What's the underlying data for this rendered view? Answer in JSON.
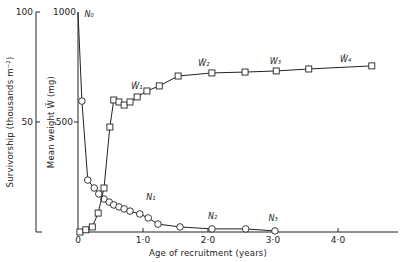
{
  "chart_data": {
    "type": "line",
    "title": "",
    "xlabel": "Age of recruitment (years)",
    "ylabel_left_outer": "Survivorship (thousands m⁻²)",
    "ylabel_left_inner": "Mean weight W̄ (mg)",
    "xlim": [
      0,
      4.9
    ],
    "ylim_survivorship": [
      0,
      100
    ],
    "ylim_weight": [
      0,
      1000
    ],
    "x_ticks": [
      {
        "value": 0,
        "label": "0"
      },
      {
        "value": 1,
        "label": "1·0"
      },
      {
        "value": 2,
        "label": "2·0"
      },
      {
        "value": 3,
        "label": "3·0"
      },
      {
        "value": 4,
        "label": "4·0"
      }
    ],
    "y_ticks_survivorship": [
      {
        "value": 50,
        "label": "50"
      },
      {
        "value": 100,
        "label": "100"
      }
    ],
    "y_ticks_weight": [
      {
        "value": 500,
        "label": "500"
      },
      {
        "value": 1000,
        "label": "1000"
      }
    ],
    "grid": false,
    "legend": null,
    "series": [
      {
        "name": "Survivorship N",
        "axis": "survivorship",
        "marker": "circle",
        "x": [
          0.0,
          0.06,
          0.15,
          0.25,
          0.32,
          0.4,
          0.48,
          0.55,
          0.63,
          0.71,
          0.8,
          0.95,
          1.08,
          1.23,
          1.57,
          2.06,
          2.58,
          3.03
        ],
        "values": [
          100,
          59.5,
          23.6,
          20.0,
          17.3,
          15.0,
          13.6,
          12.3,
          11.4,
          10.5,
          9.5,
          8.2,
          6.4,
          3.6,
          2.3,
          1.4,
          1.4,
          0.5
        ],
        "marker_from_index": 1
      },
      {
        "name": "Mean weight W̄",
        "axis": "weight",
        "marker": "square",
        "x": [
          0.03,
          0.12,
          0.22,
          0.31,
          0.4,
          0.49,
          0.55,
          0.63,
          0.71,
          0.8,
          0.91,
          1.06,
          1.25,
          1.54,
          2.06,
          2.57,
          3.05,
          3.55,
          4.52
        ],
        "values": [
          0,
          10,
          23,
          86,
          200,
          477,
          600,
          591,
          577,
          591,
          614,
          641,
          664,
          709,
          723,
          727,
          732,
          741,
          755
        ]
      }
    ],
    "annotations": [
      {
        "text": "N₀",
        "x": 0.1,
        "y_px": 17,
        "series": "survivorship"
      },
      {
        "text": "N₁",
        "x": 1.05,
        "y_px": 200,
        "series": "survivorship"
      },
      {
        "text": "N₂",
        "x": 2.0,
        "y_px": 219,
        "series": "survivorship"
      },
      {
        "text": "N₃",
        "x": 2.93,
        "y_px": 221,
        "series": "survivorship"
      },
      {
        "text": "W̄₁",
        "x": 0.82,
        "y_px": 89,
        "series": "weight"
      },
      {
        "text": "W̄₂",
        "x": 1.85,
        "y_px": 66,
        "series": "weight"
      },
      {
        "text": "W₃",
        "x": 2.95,
        "y_px": 64,
        "series": "weight"
      },
      {
        "text": "W̄₄",
        "x": 4.03,
        "y_px": 62,
        "series": "weight"
      }
    ]
  }
}
